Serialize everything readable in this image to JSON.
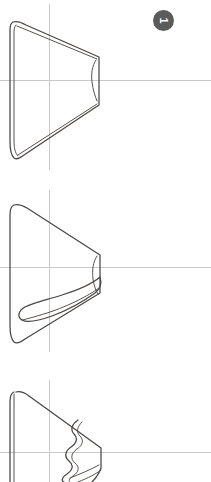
{
  "figure": {
    "title": "",
    "background_color": "#ffffff",
    "line_color": "#4a4745",
    "axis_color": "#c9c9c9",
    "badge_color": "#5b5b5b",
    "badge_text_color": "#ffffff",
    "panel_count": 3,
    "panels": [
      {
        "id": "panel-1",
        "badge_label": "1",
        "badge_rotation_degrees": 90,
        "axis": {
          "vertical_x": 49,
          "horizontal_y": 80
        },
        "description": "Outlined wedge with doubled left rim and notched right tip"
      },
      {
        "id": "panel-2",
        "badge_label": "2",
        "badge_rotation_degrees": 90,
        "axis": {
          "vertical_x": 49,
          "horizontal_y": 87
        },
        "description": "Outlined wedge with elongated internal loop sweeping to lower left"
      },
      {
        "id": "panel-3",
        "badge_label": "3",
        "badge_rotation_degrees": 90,
        "axis": {
          "vertical_x": 49,
          "horizontal_y": 92
        },
        "description": "Outlined wedge with scalloped internal contour, cropped at bottom"
      }
    ]
  }
}
